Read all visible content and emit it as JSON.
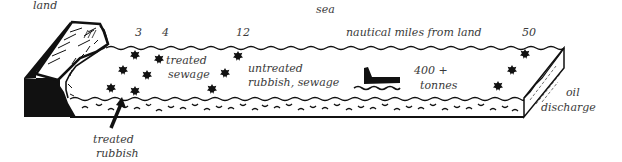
{
  "diagram": {
    "title_label": "sea",
    "land_label": "land",
    "axis_label": "nautical miles from land",
    "distance_markers": [
      "3",
      "4",
      "12",
      "50"
    ],
    "zones": {
      "treated_sewage": [
        "treated",
        "sewage"
      ],
      "untreated": [
        "untreated",
        "rubbish, sewage"
      ],
      "ship_tonnage": [
        "400 +",
        "tonnes"
      ],
      "oil_discharge": [
        "oil",
        "discharge"
      ],
      "treated_rubbish": [
        "treated",
        "rubbish"
      ]
    },
    "icons": {
      "pollution_marker": "star-burst-icon",
      "ship": "ship-icon",
      "arrow": "arrow-up-icon"
    },
    "colors": {
      "ink": "#111111",
      "text": "#3a3a3a",
      "background": "#ffffff"
    }
  }
}
